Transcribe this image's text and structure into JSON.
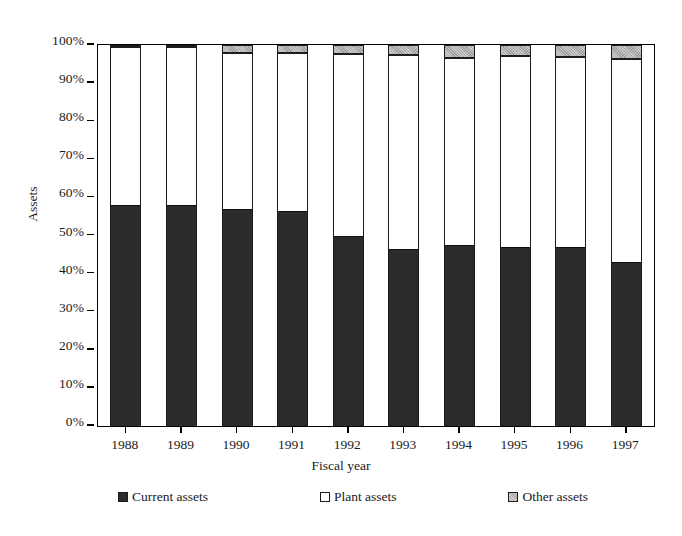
{
  "chart_data": {
    "type": "bar",
    "stacked": true,
    "stacked_normalized": true,
    "title": "",
    "xlabel": "Fiscal year",
    "ylabel": "Assets",
    "categories": [
      "1988",
      "1989",
      "1990",
      "1991",
      "1992",
      "1993",
      "1994",
      "1995",
      "1996",
      "1997"
    ],
    "series": [
      {
        "name": "Current assets",
        "color": "#2b2b2b",
        "values": [
          58,
          58,
          57,
          56.5,
          50,
          46.5,
          47.5,
          47,
          47,
          43
        ]
      },
      {
        "name": "Plant assets",
        "color": "#ffffff",
        "values": [
          41.5,
          41.5,
          41,
          41.5,
          47.6,
          50.9,
          49.1,
          50,
          49.8,
          53.3
        ]
      },
      {
        "name": "Other assets",
        "color": "#a8a8a8",
        "values": [
          0.5,
          0.5,
          2,
          2,
          2.4,
          2.6,
          3.4,
          3,
          3.2,
          3.7
        ]
      }
    ],
    "ylim": [
      0,
      100
    ],
    "yticks": [
      "0%",
      "10%",
      "20%",
      "30%",
      "40%",
      "50%",
      "60%",
      "70%",
      "80%",
      "90%",
      "100%"
    ],
    "ytick_values": [
      0,
      10,
      20,
      30,
      40,
      50,
      60,
      70,
      80,
      90,
      100
    ],
    "grid": false,
    "legend_position": "bottom",
    "legend": [
      "Current assets",
      "Plant assets",
      "Other assets"
    ]
  }
}
